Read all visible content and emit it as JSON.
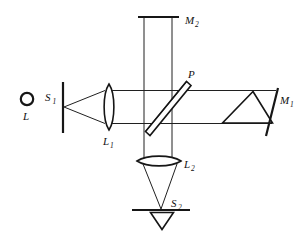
{
  "figure": {
    "type": "optical-ray-diagram",
    "background_color": "#ffffff",
    "line_color": "#161616",
    "width": 303,
    "height": 237
  },
  "labels": {
    "lamp": {
      "text": "L",
      "sub": "",
      "x": 27,
      "y": 118
    },
    "source_slit": {
      "text": "S",
      "sub": "1",
      "x": 47,
      "y": 100
    },
    "lens_1": {
      "text": "L",
      "sub": "1",
      "x": 104,
      "y": 144
    },
    "mirror_2": {
      "text": "M",
      "sub": "2",
      "x": 186,
      "y": 24
    },
    "plate": {
      "text": "P",
      "sub": "",
      "x": 189,
      "y": 77
    },
    "mirror_1": {
      "text": "M",
      "sub": "1",
      "x": 278,
      "y": 103
    },
    "lens_2": {
      "text": "L",
      "sub": "2",
      "x": 185,
      "y": 168
    },
    "screen_slit": {
      "text": "S",
      "sub": "2",
      "x": 172,
      "y": 207
    }
  },
  "components": [
    {
      "name": "lamp",
      "label": "L",
      "kind": "circle-source",
      "cx": 27,
      "cy": 99,
      "r": 6
    },
    {
      "name": "source-slit",
      "label": "S1",
      "kind": "vertical-slit",
      "x": 63,
      "y1": 82,
      "y2": 133
    },
    {
      "name": "collimating-lens",
      "label": "L1",
      "kind": "biconvex-lens",
      "cx": 109,
      "cy": 107,
      "half_height": 23,
      "half_width": 6
    },
    {
      "name": "beam-splitter",
      "label": "P",
      "kind": "tilted-plate",
      "angle_deg": 45
    },
    {
      "name": "mirror-top",
      "label": "M2",
      "kind": "flat-mirror",
      "x1": 139,
      "x2": 178,
      "y": 17
    },
    {
      "name": "prism",
      "label": "",
      "kind": "triangular-prism",
      "apex_x": 253,
      "apex_y": 92,
      "base_y": 123,
      "base_x1": 222,
      "base_x2": 272
    },
    {
      "name": "mirror-right",
      "label": "M1",
      "kind": "tilted-mirror",
      "x1": 277,
      "y1": 89,
      "x2": 267,
      "y2": 135
    },
    {
      "name": "focusing-lens",
      "label": "L2",
      "kind": "biconvex-lens-wide",
      "cx": 159,
      "cy": 161,
      "half_width": 22,
      "half_height": 6
    },
    {
      "name": "observation-screen",
      "label": "S2",
      "kind": "horizontal-screen",
      "x1": 133,
      "x2": 189,
      "y": 210
    },
    {
      "name": "detector",
      "label": "",
      "kind": "inverted-triangle",
      "x1": 151,
      "x2": 174,
      "y_top": 212,
      "apex_x": 162,
      "apex_y": 229
    }
  ],
  "beams": {
    "diverging_from_slit": {
      "origin_x": 63,
      "origin_y": 107,
      "to_x": 104,
      "top_y": 91,
      "bottom_y": 123
    },
    "collimated_horizontal": {
      "x_start": 114,
      "x_end": 277,
      "y_top": 91,
      "y_bottom": 123
    },
    "vertical_arm": {
      "x_left": 144,
      "x_right": 172,
      "y_top": 17,
      "y_bottom": 160
    },
    "converging_to_screen": {
      "x_left": 141,
      "x_right": 178,
      "y_lens": 164,
      "focus_x": 161,
      "focus_y": 209
    }
  }
}
